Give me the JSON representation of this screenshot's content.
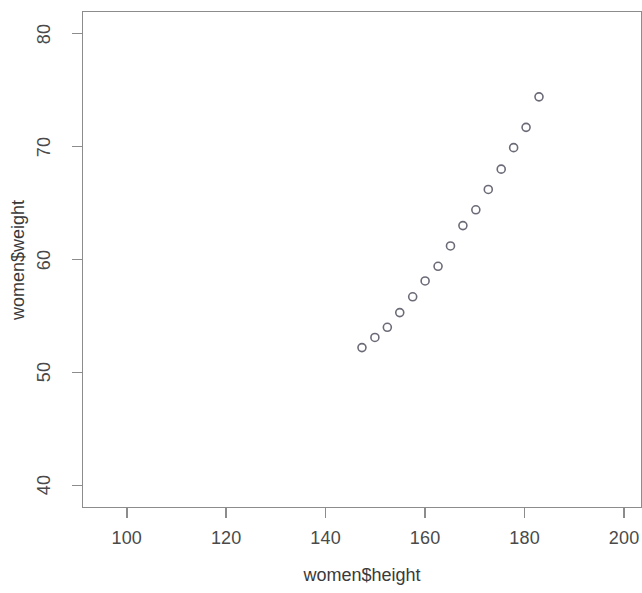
{
  "chart_data": {
    "type": "scatter",
    "title": "",
    "xlabel": "women$height",
    "ylabel": "women$weight",
    "xlim": [
      91.0,
      201.2
    ],
    "ylim": [
      38.0,
      82.0
    ],
    "xticks": [
      100,
      120,
      140,
      160,
      180,
      200
    ],
    "yticks": [
      40,
      50,
      60,
      70,
      80
    ],
    "xticklabels": [
      "100",
      "120",
      "140",
      "160",
      "180",
      "200"
    ],
    "yticklabels": [
      "40",
      "50",
      "60",
      "70",
      "80"
    ],
    "grid": false,
    "legend": null,
    "marker": "open-circle",
    "marker_color": "#6b6b78",
    "marker_radius_px": 4.0,
    "series": [
      {
        "name": "women",
        "x": [
          147.3,
          149.9,
          152.4,
          154.9,
          157.5,
          160.0,
          162.6,
          165.1,
          167.6,
          170.2,
          172.7,
          175.3,
          177.8,
          180.3,
          182.9
        ],
        "y": [
          52.2,
          53.1,
          54.0,
          55.3,
          56.7,
          58.1,
          59.4,
          61.2,
          63.0,
          64.4,
          66.2,
          68.0,
          69.9,
          71.7,
          74.4
        ]
      }
    ]
  },
  "axes": {
    "x_title": "women$height",
    "y_title": "women$weight"
  },
  "colors": {
    "frame": "#8c8c8c",
    "marker": "#6b6b78",
    "text": "#3a3a3a",
    "background": "#ffffff"
  }
}
